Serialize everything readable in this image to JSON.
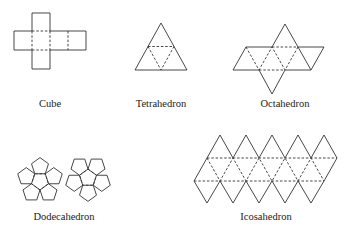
{
  "figure": {
    "background": "#ffffff",
    "line_color": "#333333"
  },
  "nets": [
    {
      "id": "cube",
      "label": "Cube",
      "label_pos": [
        50,
        107
      ],
      "faces": 6,
      "face_shape": "square"
    },
    {
      "id": "tetrahedron",
      "label": "Tetrahedron",
      "label_pos": [
        161,
        107
      ],
      "faces": 4,
      "face_shape": "triangle"
    },
    {
      "id": "octahedron",
      "label": "Octahedron",
      "label_pos": [
        285,
        107
      ],
      "faces": 8,
      "face_shape": "triangle"
    },
    {
      "id": "dodecahedron",
      "label": "Dodecahedron",
      "label_pos": [
        64,
        220
      ],
      "faces": 12,
      "face_shape": "pentagon"
    },
    {
      "id": "icosahedron",
      "label": "Icosahedron",
      "label_pos": [
        266,
        220
      ],
      "faces": 20,
      "face_shape": "triangle"
    }
  ]
}
